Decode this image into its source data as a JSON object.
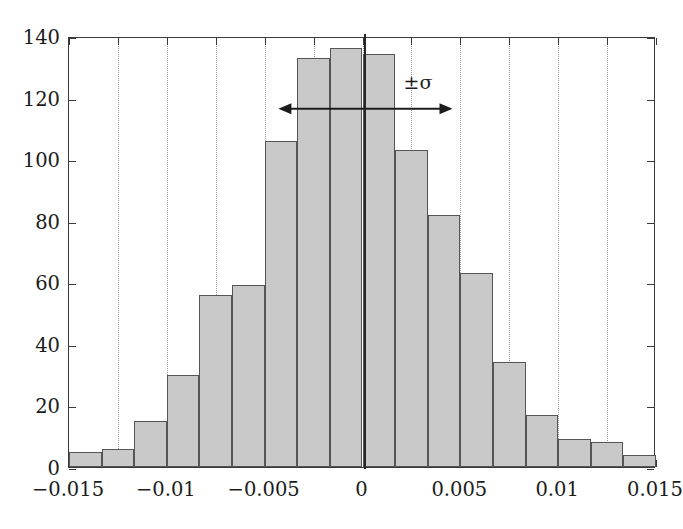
{
  "chart_data": {
    "type": "bar",
    "title": "",
    "subtitle": "",
    "xlabel": "",
    "ylabel": "",
    "xlim": [
      -0.015,
      0.015
    ],
    "ylim": [
      0,
      140
    ],
    "grid": true,
    "grid_axis": "x",
    "legend_position": "none",
    "bar_style": {
      "fill": "#c9c9c9",
      "edge": "#555555"
    },
    "bin_width": 0.0016667,
    "bin_edges": [
      -0.015,
      -0.0133333,
      -0.0116667,
      -0.01,
      -0.0083333,
      -0.0066667,
      -0.005,
      -0.0033333,
      -0.0016667,
      0,
      0.0016667,
      0.0033333,
      0.005,
      0.0066667,
      0.0083333,
      0.01,
      0.0116667,
      0.0133333,
      0.015
    ],
    "bin_centers": [
      -0.0141667,
      -0.0125,
      -0.0108333,
      -0.0091667,
      -0.0075,
      -0.0058333,
      -0.0041667,
      -0.0025,
      -0.0008333,
      0.0008333,
      0.0025,
      0.0041667,
      0.0058333,
      0.0075,
      0.0091667,
      0.0108333,
      0.0125,
      0.0141667
    ],
    "values": [
      5,
      6,
      15,
      30,
      56,
      59,
      106,
      133,
      136,
      134,
      103,
      82,
      63,
      34,
      17,
      9,
      8,
      4
    ],
    "xticks": [
      -0.015,
      -0.01,
      -0.005,
      0,
      0.005,
      0.01,
      0.015
    ],
    "xticklabels": [
      "−0.015",
      "−0.01",
      "−0.005",
      "0",
      "0.005",
      "0.01",
      "0.015"
    ],
    "xticks_minor": [
      -0.015,
      -0.0125,
      -0.01,
      -0.0075,
      -0.005,
      -0.0025,
      0,
      0.0025,
      0.005,
      0.0075,
      0.01,
      0.0125,
      0.015
    ],
    "gridline_positions": [
      -0.0125,
      -0.01,
      -0.0075,
      -0.005,
      -0.0025,
      0,
      0.0025,
      0.005,
      0.0075,
      0.01,
      0.0125
    ],
    "yticks": [
      0,
      20,
      40,
      60,
      80,
      100,
      120,
      140
    ],
    "yticklabels": [
      "0",
      "20",
      "40",
      "60",
      "80",
      "100",
      "120",
      "140"
    ],
    "annotations": [
      {
        "name": "sigma-span",
        "label": "±σ",
        "kind": "double-arrow",
        "x_start": -0.0043,
        "x_end": 0.0046,
        "y": 117,
        "label_x": 0.0021,
        "label_y": 126
      },
      {
        "name": "mean-line",
        "label": "",
        "kind": "vertical-line",
        "x": 0.0001,
        "y_start": 0,
        "y_end": 141
      }
    ]
  },
  "colors": {
    "bar_fill": "#c9c9c9",
    "bar_edge": "#555555",
    "axis": "#3a3a3a",
    "grid": "#9a9a9a",
    "text": "#1c1c1c",
    "background": "#ffffff"
  }
}
